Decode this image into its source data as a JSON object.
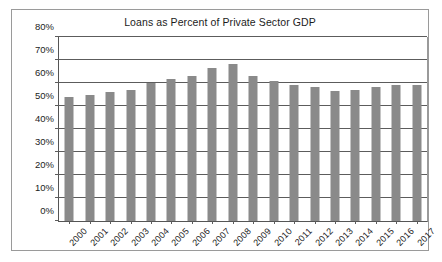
{
  "chart_data": {
    "type": "bar",
    "title": "Loans as Percent of Private Sector GDP",
    "xlabel": "",
    "ylabel": "",
    "ylim": [
      0,
      80
    ],
    "ytick_labels": [
      "0%",
      "10%",
      "20%",
      "30%",
      "40%",
      "50%",
      "60%",
      "70%",
      "80%"
    ],
    "ytick_values": [
      0,
      10,
      20,
      30,
      40,
      50,
      60,
      70,
      80
    ],
    "grid": true,
    "legend": "none",
    "bar_color": "#8a8a8a",
    "categories": [
      "2000",
      "2001",
      "2002",
      "2003",
      "2004",
      "2005",
      "2006",
      "2007",
      "2008",
      "2009",
      "2010",
      "2011",
      "2012",
      "2013",
      "2014",
      "2015",
      "2016",
      "2017"
    ],
    "values": [
      54,
      54.8,
      56.3,
      56.8,
      60,
      61.8,
      63.2,
      66.6,
      68.2,
      63.2,
      61,
      59,
      58.3,
      56.6,
      57,
      58.4,
      59.2,
      59.1
    ]
  }
}
